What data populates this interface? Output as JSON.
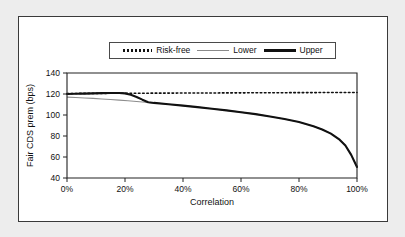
{
  "chart_data": {
    "type": "line",
    "title": "",
    "xlabel": "Correlation",
    "ylabel": "Fair CDS prem (bps)",
    "xlim": [
      0,
      100
    ],
    "ylim": [
      40,
      140
    ],
    "xticks": [
      0,
      20,
      40,
      60,
      80,
      100
    ],
    "xticklabels": [
      "0%",
      "20%",
      "40%",
      "60%",
      "80%",
      "100%"
    ],
    "yticks": [
      40,
      60,
      80,
      100,
      120,
      140
    ],
    "yticklabels": [
      "40",
      "60",
      "80",
      "100",
      "120",
      "140"
    ],
    "grid": false,
    "legend_position": "top-center",
    "series": [
      {
        "name": "Risk-free",
        "style": "dotted",
        "color": "#111111",
        "x": [
          0,
          100
        ],
        "values": [
          120.5,
          121.5
        ]
      },
      {
        "name": "Lower",
        "style": "thin-solid",
        "color": "#8d8d8d",
        "x": [
          0,
          3,
          6,
          9,
          12,
          15,
          18,
          21,
          24,
          27,
          30,
          35,
          40,
          45,
          50,
          55,
          60,
          65,
          70,
          75,
          80,
          85,
          88,
          91,
          94,
          96,
          98,
          100
        ],
        "values": [
          117.0,
          116.6,
          116.2,
          115.8,
          115.3,
          114.8,
          114.2,
          113.6,
          112.9,
          112.2,
          111.5,
          110.2,
          108.9,
          107.5,
          106.0,
          104.4,
          102.7,
          100.8,
          98.6,
          96.2,
          93.3,
          89.3,
          86.2,
          82.3,
          76.5,
          71.0,
          62.0,
          50.5
        ]
      },
      {
        "name": "Upper",
        "style": "thick-solid",
        "color": "#111111",
        "x": [
          0,
          3,
          6,
          9,
          12,
          15,
          18,
          20,
          22,
          24,
          26,
          28,
          30,
          35,
          40,
          45,
          50,
          55,
          60,
          65,
          70,
          75,
          80,
          85,
          88,
          91,
          94,
          96,
          98,
          100
        ],
        "values": [
          120.0,
          120.2,
          120.4,
          120.6,
          120.8,
          121.0,
          120.9,
          120.6,
          119.2,
          117.2,
          114.6,
          112.2,
          111.5,
          110.2,
          108.9,
          107.5,
          106.0,
          104.4,
          102.7,
          100.8,
          98.6,
          96.2,
          93.3,
          89.3,
          86.2,
          82.3,
          76.5,
          71.0,
          62.0,
          50.5
        ]
      }
    ]
  },
  "legend": {
    "items": [
      {
        "label": "Risk-free"
      },
      {
        "label": "Lower"
      },
      {
        "label": "Upper"
      }
    ]
  }
}
